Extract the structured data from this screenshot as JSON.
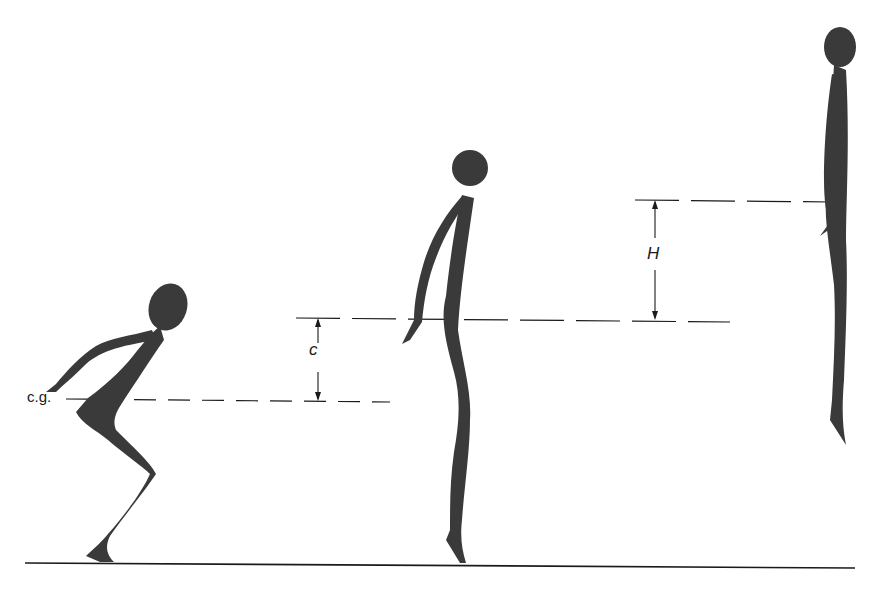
{
  "diagram": {
    "labels": {
      "center_of_gravity": "c.g.",
      "crouch_to_takeoff_distance": "c",
      "jump_height": "H"
    },
    "figures": [
      {
        "name": "crouched-figure",
        "phase": "crouch"
      },
      {
        "name": "takeoff-figure",
        "phase": "takeoff"
      },
      {
        "name": "airborne-figure",
        "phase": "peak"
      }
    ],
    "colors": {
      "figure_fill": "#3a3a3a",
      "line": "#1a1a1a",
      "background": "#ffffff"
    }
  }
}
